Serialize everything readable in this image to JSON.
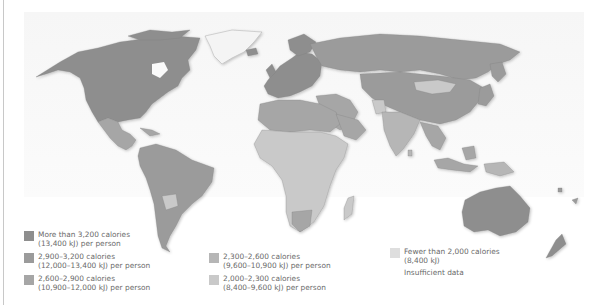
{
  "map": {
    "subject": "Daily calorie intake per person by country",
    "colors": {
      "more_than_3200": "#8e8e8e",
      "2900_3200": "#9b9b9b",
      "2600_2900": "#a6a6a6",
      "2300_2600": "#b6b6b6",
      "2000_2300": "#c9c9c9",
      "fewer_than_2000": "#dedede",
      "insufficient_data": "#ffffff",
      "ocean": "#ffffff",
      "panel": "#f7f7f7"
    }
  },
  "legend": {
    "items": [
      {
        "id": "more_than_3200",
        "line1": "More than 3,200 calories",
        "line2": "(13,400 kJ) per person",
        "color": "#8e8e8e"
      },
      {
        "id": "2900_3200",
        "line1": "2,900–3,200 calories",
        "line2": "(12,000–13,400 kJ) per person",
        "color": "#9b9b9b"
      },
      {
        "id": "2600_2900",
        "line1": "2,600–2,900 calories",
        "line2": "(10,900–12,000 kJ) per person",
        "color": "#a6a6a6"
      },
      {
        "id": "2300_2600",
        "line1": "2,300–2,600 calories",
        "line2": "(9,600–10,900 kJ) per person",
        "color": "#b6b6b6"
      },
      {
        "id": "2000_2300",
        "line1": "2,000–2,300 calories",
        "line2": "(8,400–9,600 kJ) per person",
        "color": "#c9c9c9"
      },
      {
        "id": "fewer_than_2000",
        "line1": "Fewer than 2,000 calories",
        "line2": "(8,400 kJ)",
        "color": "#dedede"
      },
      {
        "id": "insufficient_data",
        "line1": "Insufficient data",
        "line2": "",
        "color": "#ffffff"
      }
    ]
  }
}
